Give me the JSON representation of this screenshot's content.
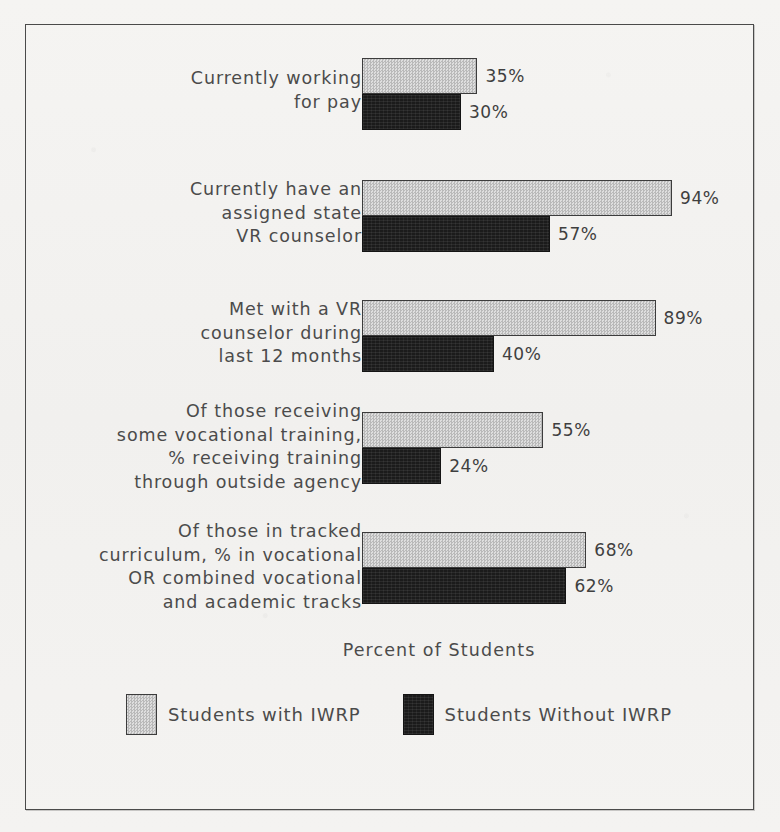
{
  "chart_data": {
    "type": "bar",
    "orientation": "horizontal",
    "title": "",
    "xlabel": "Percent of Students",
    "ylabel": "",
    "xlim": [
      0,
      100
    ],
    "grid": false,
    "legend_position": "bottom",
    "value_suffix": "%",
    "categories": [
      "Currently working\nfor pay",
      "Currently have an\nassigned state\nVR counselor",
      "Met with a VR\ncounselor during\nlast 12 months",
      "Of those receiving\nsome vocational training,\n% receiving training\nthrough outside agency",
      "Of those in tracked\ncurriculum, % in vocational\nOR combined vocational\nand academic tracks"
    ],
    "series": [
      {
        "name": "Students with IWRP",
        "color": "#c9c9c9",
        "values": [
          35,
          94,
          89,
          55,
          68
        ],
        "labels": [
          "35%",
          "94%",
          "89%",
          "55%",
          "68%"
        ]
      },
      {
        "name": "Students Without IWRP",
        "color": "#1b1b1b",
        "values": [
          30,
          57,
          40,
          24,
          62
        ],
        "labels": [
          "30%",
          "57%",
          "40%",
          "24%",
          "62%"
        ]
      }
    ]
  },
  "legend": {
    "items": [
      {
        "label": "Students with IWRP",
        "swatch": "light"
      },
      {
        "label": "Students Without IWRP",
        "swatch": "dark"
      }
    ]
  },
  "axis": {
    "title": "Percent of Students"
  },
  "groups": [
    {
      "label": "Currently working\nfor pay",
      "top": 58,
      "light": {
        "value": 35,
        "label": "35%"
      },
      "dark": {
        "value": 30,
        "label": "30%"
      }
    },
    {
      "label": "Currently have an\nassigned state\nVR counselor",
      "top": 180,
      "light": {
        "value": 94,
        "label": "94%"
      },
      "dark": {
        "value": 57,
        "label": "57%"
      }
    },
    {
      "label": "Met with a VR\ncounselor during\nlast 12 months",
      "top": 300,
      "light": {
        "value": 89,
        "label": "89%"
      },
      "dark": {
        "value": 40,
        "label": "40%"
      }
    },
    {
      "label": "Of those receiving\nsome vocational training,\n% receiving training\nthrough outside agency",
      "top": 412,
      "light": {
        "value": 55,
        "label": "55%"
      },
      "dark": {
        "value": 24,
        "label": "24%"
      }
    },
    {
      "label": "Of those in tracked\ncurriculum, % in vocational\nOR combined vocational\nand academic tracks",
      "top": 532,
      "light": {
        "value": 68,
        "label": "68%"
      },
      "dark": {
        "value": 62,
        "label": "62%"
      }
    }
  ]
}
